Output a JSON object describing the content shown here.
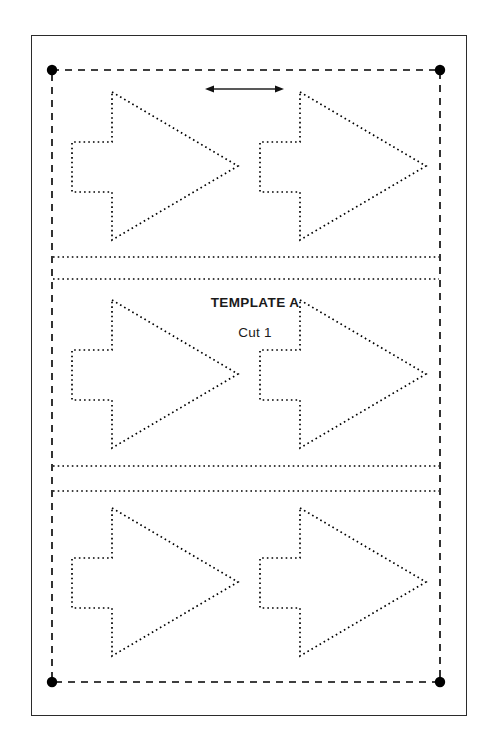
{
  "document": {
    "kind": "cutting-template-sheet",
    "background_color": "#ffffff",
    "ink_color": "#000000",
    "frame_color": "#2b2b2b"
  },
  "labels": {
    "title": "TEMPLATE A",
    "title_x": 255,
    "title_y": 296,
    "subtitle": "Cut 1",
    "subtitle_x": 255,
    "subtitle_y": 326
  },
  "page_frame": {
    "x": 31,
    "y": 35,
    "width": 436,
    "height": 681,
    "stroke_width": 1.4
  },
  "registration": {
    "left": 52,
    "top": 70,
    "right": 440,
    "bottom": 682,
    "dash_pattern": "7,6",
    "stroke_width": 1.6,
    "dot_radius": 5.2,
    "dot_color": "#000000",
    "corner_dots": [
      {
        "name": "top-left",
        "x": 52,
        "y": 70
      },
      {
        "name": "top-right",
        "x": 440,
        "y": 70
      },
      {
        "name": "bottom-left",
        "x": 52,
        "y": 682
      },
      {
        "name": "bottom-right",
        "x": 440,
        "y": 682
      }
    ]
  },
  "dimension_arrow": {
    "x1": 205,
    "x2": 284,
    "y": 89,
    "stroke_width": 1.5,
    "head_length": 9,
    "head_width": 7
  },
  "cut_separators": [
    {
      "name": "separator-1a",
      "x1": 53,
      "x2": 439,
      "y": 257
    },
    {
      "name": "separator-1b",
      "x1": 53,
      "x2": 439,
      "y": 279
    },
    {
      "name": "separator-2a",
      "x1": 53,
      "x2": 439,
      "y": 466
    },
    {
      "name": "separator-2b",
      "x1": 53,
      "x2": 439,
      "y": 491
    }
  ],
  "shape_style": {
    "stroke": "#000000",
    "stroke_width": 1.7,
    "dash_pattern": "1.6,3.1",
    "fill": "none"
  },
  "arrow_shape": {
    "description": "right-pointing arrow with rectangular tail",
    "vertices": [
      [
        112,
        92
      ],
      [
        238,
        166
      ],
      [
        112,
        240
      ],
      [
        112,
        192
      ],
      [
        72,
        192
      ],
      [
        72,
        142
      ],
      [
        112,
        142
      ]
    ],
    "width": 166,
    "height": 148
  },
  "grid": {
    "rows": 3,
    "columns": 2,
    "column_offset": 188,
    "row_offset": 208,
    "instances": [
      {
        "name": "arrow-r1-c1",
        "dx": 0,
        "dy": 0
      },
      {
        "name": "arrow-r1-c2",
        "dx": 188,
        "dy": 0
      },
      {
        "name": "arrow-r2-c1",
        "dx": 0,
        "dy": 208
      },
      {
        "name": "arrow-r2-c2",
        "dx": 188,
        "dy": 208
      },
      {
        "name": "arrow-r3-c1",
        "dx": 0,
        "dy": 416
      },
      {
        "name": "arrow-r3-c2",
        "dx": 188,
        "dy": 416
      }
    ]
  }
}
